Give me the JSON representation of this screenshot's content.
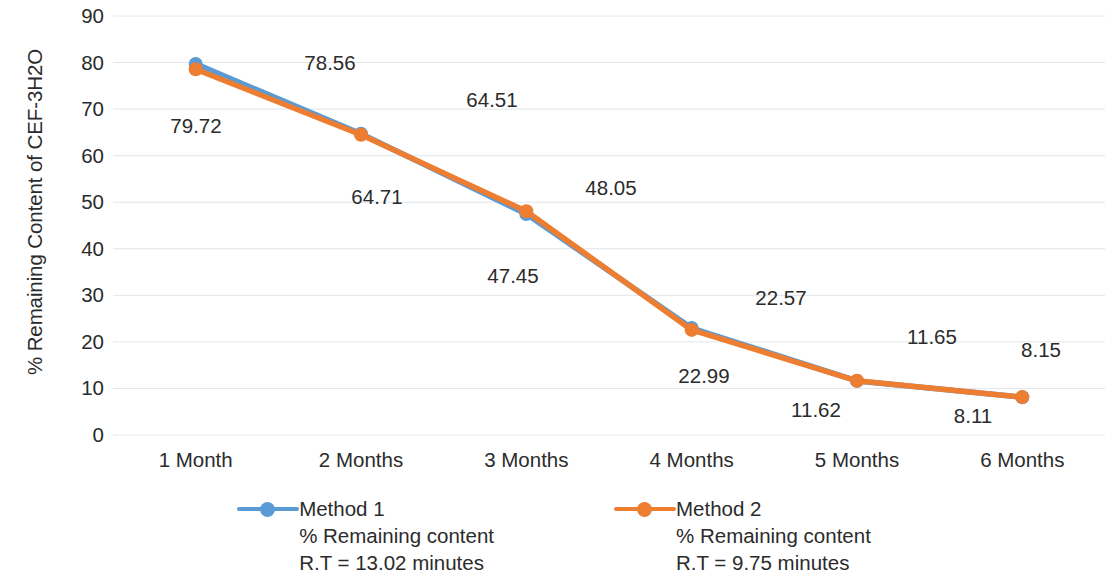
{
  "chart_data": {
    "type": "line",
    "title": "",
    "xlabel": "",
    "ylabel": "% Remaining Content of CEF-3H2O",
    "ylim": [
      0,
      90
    ],
    "ytick_step": 10,
    "yticks": [
      "90",
      "80",
      "70",
      "60",
      "50",
      "40",
      "30",
      "20",
      "10",
      "0"
    ],
    "grid": true,
    "legend_position": "bottom",
    "categories": [
      "1 Month",
      "2 Months",
      "3 Months",
      "4 Months",
      "5 Months",
      "6 Months"
    ],
    "series": [
      {
        "name": "Method 1",
        "color": "#5B9BD5",
        "legend_line2": "% Remaining content",
        "legend_line3": "R.T = 13.02 minutes",
        "values": [
          79.72,
          64.71,
          47.45,
          22.99,
          11.62,
          8.11
        ],
        "value_labels": [
          "79.72",
          "64.71",
          "47.45",
          "22.99",
          "11.62",
          "8.11"
        ]
      },
      {
        "name": "Method 2",
        "color": "#ED7D31",
        "legend_line2": "% Remaining content",
        "legend_line3": "R.T = 9.75 minutes",
        "values": [
          78.56,
          64.51,
          48.05,
          22.57,
          11.65,
          8.15
        ],
        "value_labels": [
          "78.56",
          "64.51",
          "48.05",
          "22.57",
          "11.65",
          "8.15"
        ]
      }
    ],
    "data_label_positions": [
      {
        "text": "79.72",
        "x": 196,
        "y": 126
      },
      {
        "text": "64.71",
        "x": 377,
        "y": 197
      },
      {
        "text": "47.45",
        "x": 513,
        "y": 276
      },
      {
        "text": "22.99",
        "x": 704,
        "y": 376
      },
      {
        "text": "11.62",
        "x": 816,
        "y": 410
      },
      {
        "text": "8.11",
        "x": 973,
        "y": 416
      },
      {
        "text": "78.56",
        "x": 330,
        "y": 63
      },
      {
        "text": "64.51",
        "x": 492,
        "y": 100
      },
      {
        "text": "48.05",
        "x": 611,
        "y": 188
      },
      {
        "text": "22.57",
        "x": 781,
        "y": 298
      },
      {
        "text": "11.65",
        "x": 932,
        "y": 337
      },
      {
        "text": "8.15",
        "x": 1041,
        "y": 350
      }
    ]
  }
}
